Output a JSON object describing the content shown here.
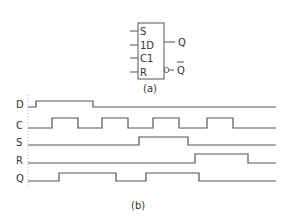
{
  "symbol": {
    "inputs": [
      {
        "label": "S",
        "y": 31
      },
      {
        "label": "1D",
        "y": 45
      },
      {
        "label": "C1",
        "y": 58
      },
      {
        "label": "R",
        "y": 72
      }
    ],
    "outputs": [
      {
        "label": "Q",
        "y": 42,
        "inverted": false
      },
      {
        "label": "Q̅",
        "y": 70,
        "inverted": true
      }
    ],
    "caption": "(a)"
  },
  "timing": {
    "caption": "(b)",
    "signals": [
      {
        "name": "D",
        "high_y": 101,
        "low_y": 107,
        "initial": 0,
        "edges": [
          36,
          93
        ]
      },
      {
        "name": "C",
        "high_y": 118,
        "low_y": 128,
        "initial": 0,
        "edges": [
          52,
          78,
          102,
          128,
          153,
          179,
          207,
          233
        ]
      },
      {
        "name": "S",
        "high_y": 137,
        "low_y": 145,
        "initial": 0,
        "edges": [
          139,
          188
        ]
      },
      {
        "name": "R",
        "high_y": 154,
        "low_y": 163,
        "initial": 0,
        "edges": [
          195,
          248
        ]
      },
      {
        "name": "Q",
        "high_y": 173,
        "low_y": 181,
        "initial": 0,
        "edges": [
          59,
          116,
          146,
          199
        ]
      }
    ],
    "x_start": 28,
    "x_end": 276
  },
  "chart_data": {
    "type": "timing-diagram",
    "x": [
      28,
      36,
      52,
      59,
      78,
      93,
      102,
      116,
      128,
      139,
      146,
      153,
      179,
      188,
      195,
      199,
      207,
      233,
      248,
      276
    ],
    "series": [
      {
        "name": "D",
        "transitions_x": [
          36,
          93
        ],
        "initial": 0
      },
      {
        "name": "C",
        "transitions_x": [
          52,
          78,
          102,
          128,
          153,
          179,
          207,
          233
        ],
        "initial": 0
      },
      {
        "name": "S",
        "transitions_x": [
          139,
          188
        ],
        "initial": 0
      },
      {
        "name": "R",
        "transitions_x": [
          195,
          248
        ],
        "initial": 0
      },
      {
        "name": "Q",
        "transitions_x": [
          59,
          116,
          146,
          199
        ],
        "initial": 0
      }
    ]
  }
}
